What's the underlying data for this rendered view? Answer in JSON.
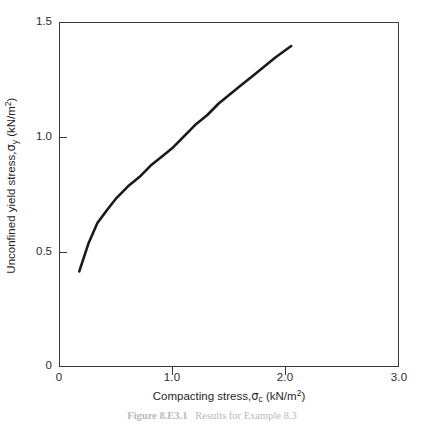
{
  "figure": {
    "caption_prefix": "Figure",
    "caption_number": "8.E3.1",
    "caption_text": "Results for Example 8.3",
    "caption_full": "Figure 8.E3.1   Results for Example 8.3"
  },
  "axes": {
    "x": {
      "title_prefix": "Compacting stress,",
      "title_symbol": "σ",
      "title_subscript": "c",
      "title_units": "(kN/m",
      "title_units_sup": "2",
      "title_units_close": ")",
      "title_full": "Compacting stress, σc (kN/m2)",
      "ticks": [
        "0",
        "1.0",
        "2.0",
        "3.0"
      ],
      "tick_values": [
        0,
        1.0,
        2.0,
        3.0
      ],
      "limits": [
        0,
        3.0
      ]
    },
    "y": {
      "title_prefix": "Unconfined yield stress,",
      "title_symbol": "σ",
      "title_subscript": "y",
      "title_units": "(kN/m",
      "title_units_sup": "2",
      "title_units_close": ")",
      "title_full": "Unconfined yield stress, σy (kN/m2)",
      "ticks": [
        "0",
        "0.5",
        "1.0",
        "1.5"
      ],
      "tick_values": [
        0,
        0.5,
        1.0,
        1.5
      ],
      "limits": [
        0,
        1.5
      ]
    }
  },
  "style": {
    "curve_color": "#1a1a1a",
    "frame_color": "#3a3a3a",
    "background": "#ffffff",
    "curve_width": 2.6
  },
  "chart_data": {
    "type": "line",
    "title": "",
    "xlabel": "Compacting stress, σc (kN/m2)",
    "ylabel": "Unconfined yield stress, σy (kN/m2)",
    "xlim": [
      0,
      3.0
    ],
    "ylim": [
      0,
      1.5
    ],
    "xticks": [
      0,
      1.0,
      2.0,
      3.0
    ],
    "yticks": [
      0,
      0.5,
      1.0,
      1.5
    ],
    "grid": false,
    "legend": null,
    "series": [
      {
        "name": "Unconfined yield stress",
        "x": [
          0.17,
          0.25,
          0.33,
          0.42,
          0.5,
          0.6,
          0.7,
          0.8,
          0.9,
          1.0,
          1.1,
          1.2,
          1.3,
          1.4,
          1.5,
          1.6,
          1.7,
          1.8,
          1.9,
          2.04
        ],
        "y": [
          0.42,
          0.54,
          0.63,
          0.69,
          0.74,
          0.79,
          0.83,
          0.88,
          0.92,
          0.96,
          1.01,
          1.06,
          1.1,
          1.15,
          1.19,
          1.23,
          1.27,
          1.31,
          1.35,
          1.4
        ]
      }
    ]
  }
}
